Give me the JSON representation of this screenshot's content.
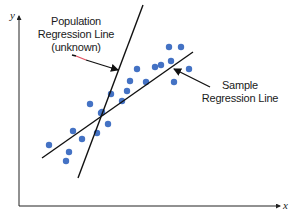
{
  "diagram": {
    "type": "scatter-with-regression-lines",
    "axes": {
      "x_label": "x",
      "y_label": "y",
      "origin": [
        19,
        206
      ],
      "x_end": [
        283,
        206
      ],
      "y_end": [
        19,
        14
      ]
    },
    "annotations": [
      {
        "id": "population",
        "lines": [
          "Population",
          "Regression Line",
          "(unknown)"
        ]
      },
      {
        "id": "sample",
        "lines": [
          "Sample",
          "Regression Line"
        ]
      }
    ],
    "lines": {
      "sample_regression": {
        "x1": 42,
        "y1": 158,
        "x2": 193,
        "y2": 52,
        "color": "#111111"
      },
      "population_regression": {
        "x1": 78,
        "y1": 178,
        "x2": 143,
        "y2": 5,
        "color": "#111111"
      }
    },
    "points_color": "#4472c4",
    "points": [
      [
        49,
        145
      ],
      [
        73,
        131
      ],
      [
        82,
        139
      ],
      [
        69,
        152
      ],
      [
        66,
        161
      ],
      [
        90,
        104
      ],
      [
        97,
        133
      ],
      [
        101,
        113
      ],
      [
        102,
        112
      ],
      [
        108,
        124
      ],
      [
        111,
        94
      ],
      [
        122,
        101
      ],
      [
        127,
        91
      ],
      [
        130,
        81
      ],
      [
        137,
        69
      ],
      [
        146,
        82
      ],
      [
        155,
        67
      ],
      [
        161,
        65
      ],
      [
        169,
        47
      ],
      [
        171,
        61
      ],
      [
        174,
        82
      ],
      [
        181,
        47
      ],
      [
        189,
        69
      ]
    ]
  },
  "chart_data": {
    "type": "scatter",
    "title": "",
    "xlabel": "x",
    "ylabel": "y",
    "series": [
      {
        "name": "Sample data points",
        "x": [
          49,
          73,
          82,
          69,
          66,
          90,
          97,
          101,
          102,
          108,
          111,
          122,
          127,
          130,
          137,
          146,
          155,
          161,
          169,
          171,
          174,
          181,
          189
        ],
        "y": [
          145,
          131,
          139,
          152,
          161,
          104,
          133,
          113,
          112,
          124,
          94,
          101,
          91,
          81,
          69,
          82,
          67,
          65,
          47,
          61,
          82,
          47,
          69
        ]
      }
    ],
    "annotations": [
      "Population Regression Line (unknown)",
      "Sample Regression Line"
    ],
    "grid": false
  }
}
